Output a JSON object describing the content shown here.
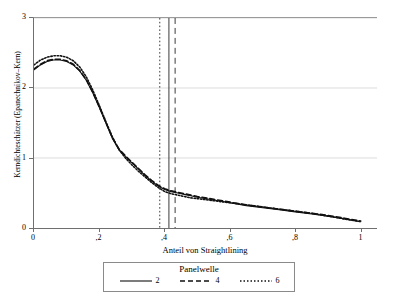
{
  "chart_data": {
    "type": "line",
    "title": "",
    "xlabel": "Anteil von Straightlining",
    "ylabel": "Kerndichteschätzer (Epanechnikov–Kern)",
    "xlim": [
      0,
      1.05
    ],
    "ylim": [
      0,
      3
    ],
    "grid": true,
    "legend_position": "bottom",
    "legend_title": "Panelwelle",
    "xticks": [
      0,
      0.2,
      0.4,
      0.6,
      0.8,
      1
    ],
    "xticklabels": [
      "0",
      ",2",
      ",4",
      ",6",
      ",8",
      "1"
    ],
    "yticks": [
      0,
      1,
      2,
      3
    ],
    "yticklabels": [
      "0",
      "1",
      "2",
      "3"
    ],
    "x": [
      0,
      0.02,
      0.04,
      0.06,
      0.08,
      0.1,
      0.12,
      0.14,
      0.16,
      0.18,
      0.2,
      0.22,
      0.24,
      0.26,
      0.28,
      0.3,
      0.32,
      0.34,
      0.36,
      0.38,
      0.4,
      0.42,
      0.44,
      0.46,
      0.48,
      0.5,
      0.55,
      0.6,
      0.65,
      0.7,
      0.75,
      0.8,
      0.85,
      0.9,
      0.95,
      1.0
    ],
    "series": [
      {
        "name": "2",
        "style": "solid",
        "values": [
          2.26,
          2.33,
          2.38,
          2.4,
          2.4,
          2.38,
          2.33,
          2.24,
          2.11,
          1.93,
          1.72,
          1.5,
          1.28,
          1.12,
          1.02,
          0.93,
          0.84,
          0.75,
          0.67,
          0.6,
          0.55,
          0.52,
          0.5,
          0.48,
          0.46,
          0.44,
          0.4,
          0.36,
          0.32,
          0.29,
          0.26,
          0.23,
          0.2,
          0.17,
          0.13,
          0.09
        ]
      },
      {
        "name": "4",
        "style": "dashed",
        "values": [
          2.27,
          2.34,
          2.39,
          2.41,
          2.41,
          2.39,
          2.34,
          2.25,
          2.12,
          1.94,
          1.73,
          1.51,
          1.29,
          1.13,
          1.03,
          0.94,
          0.85,
          0.76,
          0.68,
          0.61,
          0.56,
          0.53,
          0.51,
          0.49,
          0.47,
          0.45,
          0.41,
          0.37,
          0.33,
          0.3,
          0.27,
          0.24,
          0.21,
          0.18,
          0.14,
          0.1
        ]
      },
      {
        "name": "6",
        "style": "dotted",
        "values": [
          2.33,
          2.4,
          2.44,
          2.46,
          2.46,
          2.44,
          2.39,
          2.3,
          2.16,
          1.97,
          1.75,
          1.52,
          1.3,
          1.12,
          1.0,
          0.9,
          0.81,
          0.73,
          0.65,
          0.58,
          0.52,
          0.49,
          0.47,
          0.45,
          0.43,
          0.42,
          0.39,
          0.36,
          0.33,
          0.3,
          0.27,
          0.24,
          0.21,
          0.17,
          0.13,
          0.09
        ]
      }
    ],
    "vlines": [
      {
        "x": 0.385,
        "style": "dotted"
      },
      {
        "x": 0.413,
        "style": "solid"
      },
      {
        "x": 0.432,
        "style": "dashed"
      }
    ],
    "legend_entries": [
      {
        "label": "2",
        "style": "solid"
      },
      {
        "label": "4",
        "style": "dashed"
      },
      {
        "label": "6",
        "style": "dotted"
      }
    ]
  }
}
